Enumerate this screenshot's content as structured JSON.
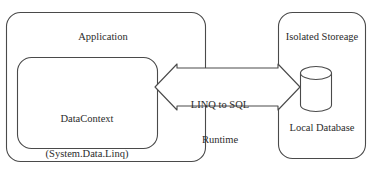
{
  "diagram": {
    "type": "block-diagram",
    "colors": {
      "stroke": "#4a4a4a",
      "text": "#2b2b2b",
      "background": "#ffffff",
      "fill": "#ffffff"
    },
    "nodes": {
      "application": {
        "label": "Application",
        "shape": "rounded-rectangle"
      },
      "datacontext": {
        "label_line1": "DataContext",
        "label_line2": "(System.Data.Linq)",
        "shape": "rounded-rectangle"
      },
      "isolated_storage": {
        "label": "Isolated Storeage",
        "shape": "rounded-rectangle"
      },
      "local_database": {
        "label": "Local Database",
        "shape": "cylinder"
      }
    },
    "connector": {
      "label_line1": "LINQ to SQL",
      "label_line2": "Runtime",
      "style": "double-headed-block-arrow",
      "from": "datacontext",
      "to": "local_database"
    }
  }
}
